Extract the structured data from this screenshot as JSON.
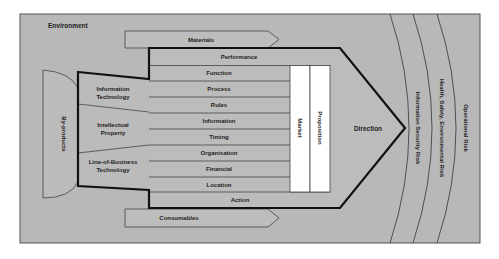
{
  "environment": {
    "label": "Environment"
  },
  "inputs": {
    "materials": "Materials",
    "consumables": "Consumables"
  },
  "left_blocks": [
    {
      "line1": "Information",
      "line2": "Technology"
    },
    {
      "line1": "Intellectual",
      "line2": "Property"
    },
    {
      "line1": "Line-of-Business",
      "line2": "Technology"
    }
  ],
  "byproducts": {
    "label": "By-products"
  },
  "rows": [
    {
      "label": "Performance"
    },
    {
      "label": "Function"
    },
    {
      "label": "Process"
    },
    {
      "label": "Rules"
    },
    {
      "label": "Information"
    },
    {
      "label": "Timing"
    },
    {
      "label": "Organisation"
    },
    {
      "label": "Financial"
    },
    {
      "label": "Location"
    },
    {
      "label": "Action"
    }
  ],
  "columns": {
    "market": "Market",
    "proposition": "Proposition"
  },
  "direction": {
    "label": "Direction"
  },
  "risks": [
    {
      "label": "Information Security Risk"
    },
    {
      "label": "Health, Safety, Environmental Risk"
    },
    {
      "label": "Operational Risk"
    }
  ],
  "colors": {
    "background": "#b7b7b7",
    "row_fill": "#bcbcbc",
    "column_fill": "#ffffff",
    "outline": "#111111",
    "text": "#1e1e1e"
  }
}
